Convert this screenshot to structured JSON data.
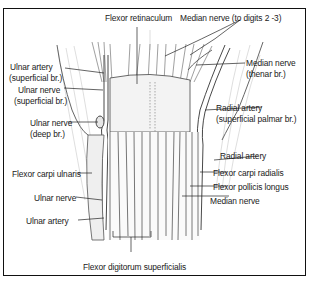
{
  "figure": {
    "labels": {
      "flexor_retinaculum": "Flexor retinaculum",
      "median_nerve_digits": "Median nerve (to digits 2 -3)",
      "ulnar_artery_superficial_1": "Ulnar artery",
      "ulnar_artery_superficial_2": "(superficial br.)",
      "ulnar_nerve_superficial_1": "Ulnar nerve",
      "ulnar_nerve_superficial_2": "(superficial br.)",
      "ulnar_nerve_deep_1": "Ulnar nerve",
      "ulnar_nerve_deep_2": "(deep br.)",
      "median_nerve_thenar_1": "Median nerve",
      "median_nerve_thenar_2": "(thenar br.)",
      "radial_artery_palmar_1": "Radial artery",
      "radial_artery_palmar_2": "(superficial palmar br.)",
      "radial_artery": "Radial artery",
      "flexor_carpi_ulnaris": "Flexor carpi ulnaris",
      "flexor_carpi_radialis": "Flexor carpi radialis",
      "flexor_pollicis_longus": "Flexor pollicis longus",
      "median_nerve": "Median nerve",
      "ulnar_nerve": "Ulnar nerve",
      "ulnar_artery": "Ulnar artery",
      "flexor_digitorum_superficialis": "Flexor digitorum superficialis"
    },
    "colors": {
      "line": "#222222",
      "sketch": "#8a8a8a",
      "shade": "#d9d9d9",
      "border": "#111111"
    }
  }
}
